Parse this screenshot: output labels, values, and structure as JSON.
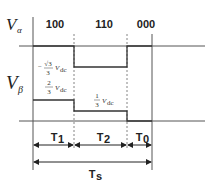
{
  "diagram": {
    "axes": {
      "v_alpha_label": "V",
      "v_alpha_sub": "α",
      "v_beta_label": "V",
      "v_beta_sub": "β"
    },
    "states": [
      "100",
      "110",
      "000"
    ],
    "v_alpha_levels": [
      {
        "segment": "100",
        "value": "0"
      },
      {
        "segment": "110",
        "value": "-√3/3 Vdc",
        "num": "√3",
        "den": "3",
        "sign": "−",
        "unit": "V",
        "unit_sub": "dc"
      },
      {
        "segment": "000",
        "value": "0"
      }
    ],
    "v_beta_levels": [
      {
        "segment": "100",
        "value": "2/3 Vdc",
        "num": "2",
        "den": "3",
        "unit": "V",
        "unit_sub": "dc"
      },
      {
        "segment": "110",
        "value": "1/3 Vdc",
        "num": "1",
        "den": "3",
        "unit": "V",
        "unit_sub": "dc"
      },
      {
        "segment": "000",
        "value": "0"
      }
    ],
    "intervals": [
      {
        "label": "T",
        "sub": "1"
      },
      {
        "label": "T",
        "sub": "2"
      },
      {
        "label": "T",
        "sub": "0"
      }
    ],
    "period": {
      "label": "T",
      "sub": "s"
    },
    "colors": {
      "line": "#333333",
      "axis": "#555555",
      "dashed": "#666666"
    }
  }
}
